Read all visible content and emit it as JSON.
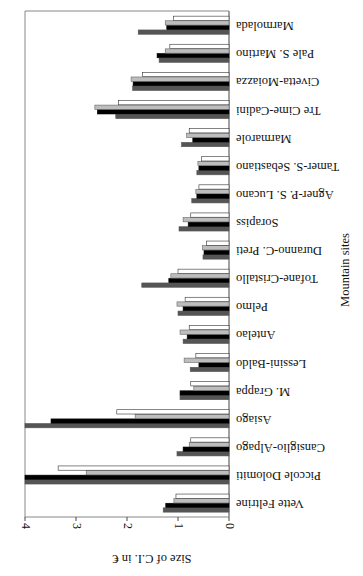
{
  "chart_data": {
    "type": "bar",
    "orientation": "horizontal",
    "rendered_rotation_deg": 180,
    "title": "",
    "xlabel": "Mountain sites",
    "ylabel": "Size of C.I. in €",
    "ylim": [
      0,
      4
    ],
    "yticks": [
      "0",
      "1",
      "2",
      "3",
      "4"
    ],
    "grid": false,
    "legend": null,
    "categories": [
      "Vette Feltrine",
      "Piccole Dolomiti",
      "Cansiglio-Alpago",
      "Asiago",
      "M. Grappa",
      "Lessini-Baldo",
      "Antelao",
      "Pelmo",
      "Tofane-Cristallo",
      "Duranno-C. Preti",
      "Sorapiss",
      "Agner-P. S. Lucano",
      "Tamer-S. Sebastiano",
      "Marmarole",
      "Tre Cime-Cadini",
      "Civetta-Moiazza",
      "Pale S. Martino",
      "Marmolada"
    ],
    "series": [
      {
        "name": "series-1",
        "color": "#555555",
        "values": [
          1.29,
          4.0,
          1.02,
          4.0,
          0.96,
          0.76,
          0.9,
          1.0,
          1.71,
          0.51,
          0.98,
          0.73,
          0.63,
          0.93,
          2.22,
          1.89,
          1.37,
          1.78
        ]
      },
      {
        "name": "series-2",
        "color": "#000000",
        "values": [
          1.24,
          4.0,
          0.9,
          3.49,
          0.96,
          0.59,
          0.82,
          0.9,
          1.18,
          0.49,
          0.8,
          0.63,
          0.59,
          0.71,
          2.58,
          1.88,
          1.41,
          1.22
        ]
      },
      {
        "name": "series-3",
        "color": "#bdbdbd",
        "values": [
          1.08,
          2.8,
          0.78,
          1.84,
          0.69,
          0.88,
          0.96,
          1.02,
          1.14,
          0.52,
          0.9,
          0.65,
          0.61,
          0.83,
          2.63,
          1.92,
          1.25,
          1.25
        ]
      },
      {
        "name": "series-4",
        "color": "#ffffff",
        "values": [
          1.04,
          3.35,
          0.75,
          2.2,
          0.75,
          0.65,
          0.78,
          0.86,
          1.0,
          0.44,
          0.75,
          0.59,
          0.54,
          0.78,
          2.17,
          1.7,
          1.16,
          1.09
        ]
      }
    ]
  }
}
